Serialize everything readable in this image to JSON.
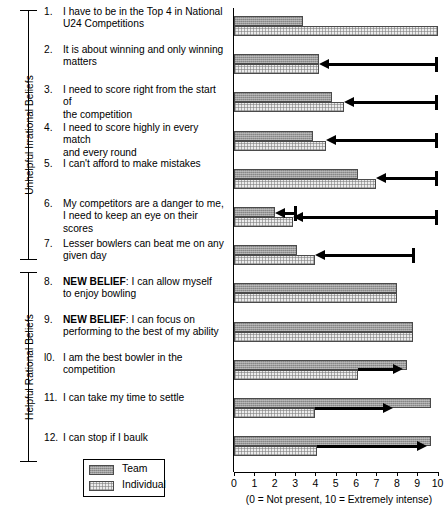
{
  "chart_data": {
    "type": "bar",
    "title": "",
    "xlabel": "(0 = Not present, 10 = Extremely intense)",
    "ylabel": "",
    "xlim": [
      0,
      10
    ],
    "xticks": [
      0,
      1,
      2,
      3,
      4,
      5,
      6,
      7,
      8,
      9,
      10
    ],
    "grid": false,
    "orientation": "horizontal",
    "legend_position": "bottom-left",
    "categories": [
      "1. I have to be in the Top 4 in  National U24 Competitions",
      "2. It is about winning and only winning matters",
      "3. I need to score right from the start of the competition",
      "4. I need to score highly in every match and every round",
      "5. I can't afford to make mistakes",
      "6. My competitors are a danger to me, I need to keep an eye on their scores",
      "7. Lesser bowlers can beat me on any given day",
      "8. NEW BELIEF: I can allow myself to enjoy bowling",
      "9. NEW BELIEF: I can focus on performing to the best of my ability",
      "l0. I am the best bowler in the competition",
      "11. I can take my time to settle",
      "12. I can stop if I baulk"
    ],
    "series": [
      {
        "name": "Team",
        "values": [
          3.4,
          4.2,
          4.8,
          3.9,
          6.1,
          2.0,
          3.1,
          8.0,
          8.8,
          8.5,
          9.7,
          9.7
        ]
      },
      {
        "name": "Individual",
        "values": [
          10.0,
          4.2,
          5.4,
          4.5,
          7.0,
          2.9,
          4.0,
          8.0,
          8.8,
          6.1,
          4.0,
          4.1
        ]
      }
    ],
    "change_arrows": [
      {
        "item": 2,
        "series": "Individual",
        "from": 10.0,
        "to": 4.2,
        "direction": "left"
      },
      {
        "item": 3,
        "series": "Individual",
        "from": 10.0,
        "to": 5.4,
        "direction": "left"
      },
      {
        "item": 4,
        "series": "Individual",
        "from": 10.0,
        "to": 4.5,
        "direction": "left"
      },
      {
        "item": 5,
        "series": "Individual",
        "from": 10.0,
        "to": 7.0,
        "direction": "left"
      },
      {
        "item": 6,
        "series": "Team",
        "from": 3.1,
        "to": 2.0,
        "direction": "left"
      },
      {
        "item": 6,
        "series": "Individual",
        "from": 10.0,
        "to": 2.9,
        "direction": "left"
      },
      {
        "item": 7,
        "series": "Individual",
        "from": 8.9,
        "to": 4.0,
        "direction": "left"
      },
      {
        "item": 10,
        "series": "Individual",
        "from": 6.1,
        "to": 8.3,
        "direction": "right"
      },
      {
        "item": 11,
        "series": "Individual",
        "from": 4.0,
        "to": 7.8,
        "direction": "right"
      },
      {
        "item": 12,
        "series": "Individual",
        "from": 4.1,
        "to": 9.5,
        "direction": "right"
      }
    ]
  },
  "groups": [
    {
      "label": "Unhelpful Irrational Beliefs",
      "items": [
        1,
        2,
        3,
        4,
        5,
        6,
        7
      ]
    },
    {
      "label": "Helpful Rational Beliefs",
      "items": [
        8,
        9,
        10,
        11,
        12
      ]
    }
  ],
  "items": [
    {
      "num": "1.",
      "lines": [
        "I have to be in the Top 4 in  National",
        "U24 Competitions"
      ],
      "bold_prefix": ""
    },
    {
      "num": "2.",
      "lines": [
        "It is about winning and only winning",
        "matters"
      ],
      "bold_prefix": ""
    },
    {
      "num": "3.",
      "lines": [
        "I need to score right from the start of",
        "the competition"
      ],
      "bold_prefix": ""
    },
    {
      "num": "4.",
      "lines": [
        "I need to score highly in every match",
        "and every round"
      ],
      "bold_prefix": ""
    },
    {
      "num": "5.",
      "lines": [
        "I can't afford to make mistakes"
      ],
      "bold_prefix": ""
    },
    {
      "num": "6.",
      "lines": [
        "My competitors are a danger to me,",
        "I need to keep an eye on their scores"
      ],
      "bold_prefix": ""
    },
    {
      "num": "7.",
      "lines": [
        "Lesser bowlers can beat me on any",
        "given day"
      ],
      "bold_prefix": ""
    },
    {
      "num": "8.",
      "lines": [
        ": I can allow myself",
        "to enjoy bowling"
      ],
      "bold_prefix": "NEW BELIEF"
    },
    {
      "num": "9.",
      "lines": [
        ": I can focus on",
        "performing to the best of my ability"
      ],
      "bold_prefix": "NEW BELIEF"
    },
    {
      "num": "l0.",
      "lines": [
        "I am the best bowler in the",
        "competition"
      ],
      "bold_prefix": ""
    },
    {
      "num": "11.",
      "lines": [
        "I can take my time to settle"
      ],
      "bold_prefix": ""
    },
    {
      "num": "12.",
      "lines": [
        "I can stop if I baulk"
      ],
      "bold_prefix": ""
    }
  ],
  "legend": {
    "entries": [
      {
        "label": "Team",
        "style": "team"
      },
      {
        "label": "Individual",
        "style": "individual"
      }
    ]
  },
  "axis": {
    "tick_labels": [
      "0",
      "1",
      "2",
      "3",
      "4",
      "5",
      "6",
      "7",
      "8",
      "9",
      "10"
    ],
    "caption": "(0 = Not present, 10 = Extremely intense)"
  },
  "colors": {
    "team_fill": "#9a9a9a",
    "individual_fill": "#ececec",
    "bar_border": "#4a4a4a",
    "arrow": "#000000",
    "background": "#ffffff"
  }
}
